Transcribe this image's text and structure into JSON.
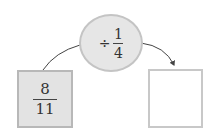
{
  "diagram": {
    "input": {
      "numerator": "8",
      "denominator": "11"
    },
    "operation": {
      "operator": "÷",
      "numerator": "1",
      "denominator": "4"
    },
    "output": {
      "value": ""
    }
  },
  "colors": {
    "input_box_fill": "#e3e3e3",
    "input_box_border": "#b8b8b8",
    "ellipse_fill": "#e6e6e6",
    "ellipse_border": "#c4c4c4",
    "output_box_border": "#c8c8c8",
    "arrow": "#444444"
  }
}
